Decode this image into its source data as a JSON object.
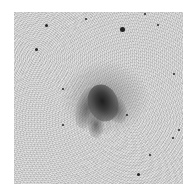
{
  "image": {
    "subject": "spiral galaxy",
    "style": "grayscale inverted astronomical image",
    "background_color": "#d9d9d9",
    "frame": {
      "x": 14,
      "y": 12,
      "width": 169,
      "height": 172
    },
    "galaxy_center": {
      "x": 97,
      "y": 95
    },
    "stars": [
      {
        "x": 122,
        "y": 29,
        "r": 2.5
      },
      {
        "x": 36,
        "y": 49,
        "r": 1.5
      },
      {
        "x": 46,
        "y": 25,
        "r": 1.5
      },
      {
        "x": 145,
        "y": 14,
        "r": 1.2
      },
      {
        "x": 86,
        "y": 19,
        "r": 1
      },
      {
        "x": 158,
        "y": 25,
        "r": 1
      },
      {
        "x": 174,
        "y": 74,
        "r": 1
      },
      {
        "x": 63,
        "y": 89,
        "r": 1
      },
      {
        "x": 63,
        "y": 125,
        "r": 1
      },
      {
        "x": 127,
        "y": 115,
        "r": 1
      },
      {
        "x": 138,
        "y": 174,
        "r": 1.5
      },
      {
        "x": 173,
        "y": 138,
        "r": 1
      },
      {
        "x": 179,
        "y": 130,
        "r": 1.2
      },
      {
        "x": 150,
        "y": 155,
        "r": 1
      }
    ]
  }
}
